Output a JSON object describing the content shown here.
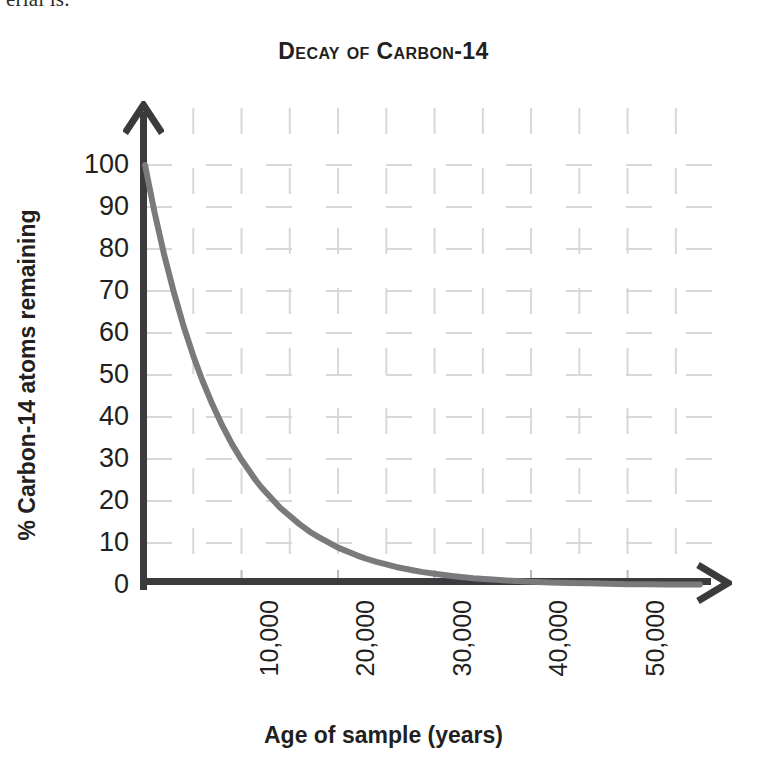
{
  "page_bleed_text": "erial is.",
  "chart_data": {
    "type": "line",
    "title": "Decay of Carbon-14",
    "xlabel": "Age of sample (years)",
    "ylabel": "% Carbon-14 atoms remaining",
    "xlim": [
      0,
      57500
    ],
    "ylim": [
      0,
      100
    ],
    "grid": true,
    "legend": "none",
    "line_color": "#7a7a7c",
    "axis_color": "#3b3b3d",
    "grid_color": "#d8d8d8",
    "text_color": "#231f20",
    "half_life_years": 5730,
    "x_ticks": [
      10000,
      20000,
      30000,
      40000,
      50000
    ],
    "x_tick_labels": [
      "10,000",
      "20,000",
      "30,000",
      "40,000",
      "50,000"
    ],
    "x_gridlines": [
      5000,
      15000,
      25000,
      35000,
      45000,
      55000
    ],
    "y_ticks": [
      0,
      10,
      20,
      30,
      40,
      50,
      60,
      70,
      80,
      90,
      100
    ],
    "y_tick_labels": [
      "0",
      "10",
      "20",
      "30",
      "40",
      "50",
      "60",
      "70",
      "80",
      "90",
      "100"
    ],
    "series": [
      {
        "name": "Carbon-14 remaining",
        "x": [
          0,
          1000,
          2000,
          3000,
          4000,
          5000,
          5730,
          6000,
          7000,
          8000,
          9000,
          10000,
          11460,
          12000,
          14000,
          16000,
          17190,
          18000,
          20000,
          22000,
          22920,
          24000,
          26000,
          28000,
          28650,
          30000,
          32000,
          34000,
          34380,
          36000,
          38000,
          40000,
          40110,
          42000,
          44000,
          45840,
          46000,
          48000,
          50000,
          52000,
          54000,
          56000,
          57500
        ],
        "y": [
          100,
          88.6,
          78.5,
          69.6,
          61.6,
          54.6,
          50.0,
          48.4,
          42.9,
          38.0,
          33.6,
          29.8,
          25.0,
          23.4,
          18.4,
          14.5,
          12.5,
          11.4,
          8.9,
          7.0,
          6.25,
          5.5,
          4.3,
          3.4,
          3.125,
          2.7,
          2.1,
          1.6,
          1.56,
          1.3,
          1.0,
          0.8,
          0.78,
          0.6,
          0.5,
          0.39,
          0.39,
          0.3,
          0.2,
          0.2,
          0.1,
          0.1,
          0.1
        ]
      }
    ]
  }
}
